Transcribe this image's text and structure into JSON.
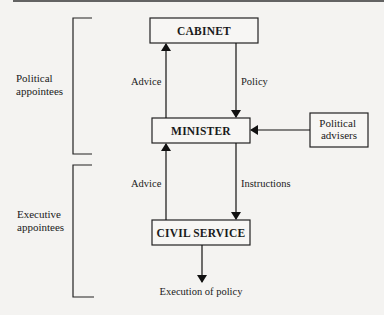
{
  "diagram": {
    "nodes": [
      {
        "id": "cabinet",
        "label": "CABINET"
      },
      {
        "id": "minister",
        "label": "MINISTER"
      },
      {
        "id": "civil_service",
        "label": "CIVIL SERVICE"
      },
      {
        "id": "political_advisers",
        "label_lines": [
          "Political",
          "advisers"
        ]
      }
    ],
    "edges": [
      {
        "from": "minister",
        "to": "cabinet",
        "label": "Advice"
      },
      {
        "from": "cabinet",
        "to": "minister",
        "label": "Policy"
      },
      {
        "from": "political_advisers",
        "to": "minister",
        "label": ""
      },
      {
        "from": "civil_service",
        "to": "minister",
        "label": "Advice"
      },
      {
        "from": "minister",
        "to": "civil_service",
        "label": "Instructions"
      },
      {
        "from": "civil_service",
        "to": "execution",
        "label": ""
      }
    ],
    "outcome": "Execution of policy",
    "groups": [
      {
        "id": "political",
        "label_lines": [
          "Political",
          "appointees"
        ]
      },
      {
        "id": "executive",
        "label_lines": [
          "Executive",
          "appointees"
        ]
      }
    ]
  }
}
